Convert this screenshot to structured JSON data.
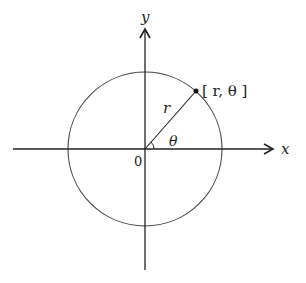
{
  "diagram": {
    "title_partial": "",
    "axes": {
      "x_label": "x",
      "y_label": "y",
      "origin_label": "0"
    },
    "point": {
      "label": "[ r,  θ ]",
      "radius_label": "r",
      "angle_label": "θ"
    },
    "colors": {
      "stroke": "#222222",
      "circle": "#444444"
    }
  }
}
